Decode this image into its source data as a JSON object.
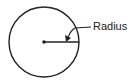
{
  "diagram": {
    "type": "circle-radius",
    "label": "Radius",
    "stroke_color": "#222222",
    "background": "#ffffff"
  }
}
